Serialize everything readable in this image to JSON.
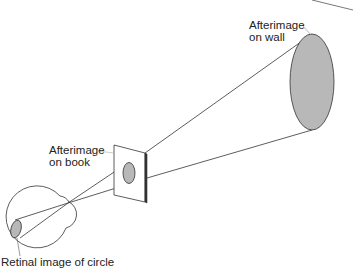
{
  "labels": {
    "wall_line1": "Afterimage",
    "wall_line2": "on wall",
    "book_line1": "Afterimage",
    "book_line2": "on book",
    "retina": "Retinal image of circle"
  },
  "colors": {
    "stroke": "#333333",
    "fill": "#b8b8b8",
    "background": "#ffffff"
  }
}
